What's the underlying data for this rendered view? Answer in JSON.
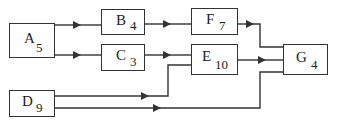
{
  "diagram": {
    "type": "activity-network",
    "nodes": [
      {
        "id": "A",
        "label": "A",
        "duration": "5",
        "x": 9,
        "y": 23,
        "w": 46,
        "h": 35
      },
      {
        "id": "B",
        "label": "B",
        "duration": "4",
        "x": 101,
        "y": 9,
        "w": 44,
        "h": 26
      },
      {
        "id": "C",
        "label": "C",
        "duration": "3",
        "x": 101,
        "y": 44,
        "w": 44,
        "h": 27
      },
      {
        "id": "D",
        "label": "D",
        "duration": "9",
        "x": 9,
        "y": 90,
        "w": 46,
        "h": 27
      },
      {
        "id": "E",
        "label": "E",
        "duration": "10",
        "x": 191,
        "y": 44,
        "w": 47,
        "h": 31
      },
      {
        "id": "F",
        "label": "F",
        "duration": "7",
        "x": 191,
        "y": 8,
        "w": 47,
        "h": 27
      },
      {
        "id": "G",
        "label": "G",
        "duration": "4",
        "x": 283,
        "y": 44,
        "w": 45,
        "h": 31
      }
    ],
    "edges": [
      {
        "from": "A",
        "to": "B"
      },
      {
        "from": "A",
        "to": "C"
      },
      {
        "from": "B",
        "to": "F"
      },
      {
        "from": "C",
        "to": "E"
      },
      {
        "from": "D",
        "to": "E"
      },
      {
        "from": "F",
        "to": "G"
      },
      {
        "from": "E",
        "to": "G"
      },
      {
        "from": "D",
        "to": "G"
      }
    ]
  },
  "style": {
    "line_color": "#333333",
    "text_color": "#222222",
    "background": "#ffffff"
  }
}
